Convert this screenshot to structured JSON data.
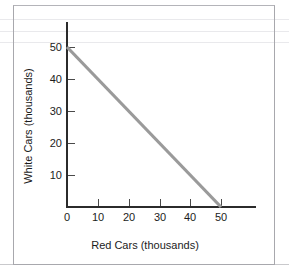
{
  "chart_data": {
    "type": "line",
    "title": "",
    "xlabel": "Red Cars (thousands)",
    "ylabel": "White Cars (thousands)",
    "xlim": [
      0,
      50
    ],
    "ylim": [
      0,
      50
    ],
    "xticks": [
      "0",
      "10",
      "20",
      "30",
      "40",
      "50"
    ],
    "yticks": [
      "0",
      "10",
      "20",
      "30",
      "40",
      "50"
    ],
    "grid": false,
    "legend": null,
    "series": [
      {
        "name": "budget-line",
        "color": "#9a9a9a",
        "x": [
          0,
          50
        ],
        "values": [
          50,
          0
        ],
        "points": [
          {
            "x": 0,
            "y": 50
          },
          {
            "x": 50,
            "y": 0
          }
        ]
      }
    ],
    "annotations": []
  },
  "figure": {
    "x_axis_title": "Red Cars (thousands)",
    "y_axis_title": "White Cars (thousands)",
    "x_tick_labels": [
      "0",
      "10",
      "20",
      "30",
      "40",
      "50"
    ],
    "y_tick_labels": [
      "10",
      "20",
      "30",
      "40",
      "50"
    ],
    "line_color": "#9a9a9a",
    "axis_color": "#2b2b2b",
    "frame_color": "#a8a8ad"
  }
}
